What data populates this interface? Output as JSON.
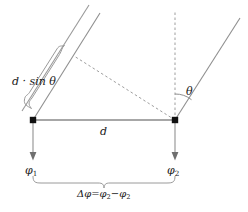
{
  "figure": {
    "type": "geometry-diagram",
    "width": 248,
    "height": 212,
    "background_color": "#ffffff",
    "line_color": "#8a8a8a",
    "text_color": "#1a1a1a",
    "marker_color": "#111111"
  },
  "labels": {
    "path_difference": "d · sin θ",
    "separation": "d",
    "angle": "θ",
    "phase_left": "φ",
    "phase_left_sub": "1",
    "phase_right": "φ",
    "phase_right_sub": "2",
    "phase_difference_lhs": "Δφ=φ",
    "phase_difference_sub1": "2",
    "phase_difference_mid": "−φ",
    "phase_difference_sub2": "2"
  },
  "geometry": {
    "left_vertex": {
      "x": 33,
      "y": 120
    },
    "right_vertex": {
      "x": 175,
      "y": 120
    },
    "baseline": {
      "x1": 33,
      "y1": 120,
      "x2": 175,
      "y2": 120
    },
    "ray_left": {
      "x1": 33,
      "y1": 120,
      "x2": 100,
      "y2": 13
    },
    "ray_left_parallel": {
      "x1": 22,
      "y1": 111,
      "x2": 89,
      "y2": 5
    },
    "ray_right": {
      "x1": 175,
      "y1": 120,
      "x2": 239,
      "y2": 19
    },
    "dashed_vertical": {
      "x1": 175,
      "y1": 120,
      "x2": 175,
      "y2": 12
    },
    "dashed_wavefront": {
      "x1": 175,
      "y1": 120,
      "x2": 75,
      "y2": 57
    },
    "arrow_left": {
      "x1": 33,
      "y1": 121,
      "x2": 33,
      "y2": 160
    },
    "arrow_right": {
      "x1": 175,
      "y1": 121,
      "x2": 175,
      "y2": 160
    },
    "theta_arc_radius": 26,
    "brace_path_span": [
      33,
      175
    ],
    "brace_bottom_y": 182
  }
}
